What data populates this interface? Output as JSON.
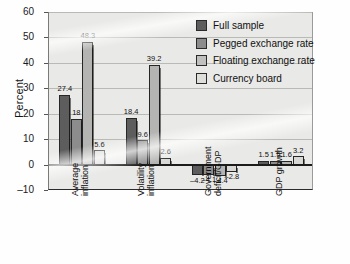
{
  "chart_data": {
    "type": "bar",
    "title": "",
    "xlabel": "",
    "ylabel": "Percent",
    "ylim": [
      -10,
      60
    ],
    "yticks": [
      60,
      50,
      40,
      30,
      20,
      10,
      0,
      -10
    ],
    "grid": true,
    "legend_position": "inside-top-right",
    "categories": [
      "Average inflation",
      "Volatility inflation",
      "Government deficit/GDP",
      "GDP growth"
    ],
    "category_lines": [
      [
        "Average",
        "inflation"
      ],
      [
        "Volatility",
        "inflation"
      ],
      [
        "Government",
        "deficit/GDP"
      ],
      [
        "GDP growth"
      ]
    ],
    "series": [
      {
        "name": "Full sample",
        "color": "#5d5d5d",
        "values": [
          27.4,
          18.4,
          -4.2,
          1.5
        ],
        "labels": [
          "27.4",
          "18.4",
          "–4.2",
          "1.5"
        ]
      },
      {
        "name": "Pegged exchange rate",
        "color": "#8c8c8c",
        "values": [
          18,
          9.6,
          -4.1,
          1.5
        ],
        "labels": [
          "18",
          "9.6",
          "–4.1",
          "1.5"
        ]
      },
      {
        "name": "Floating exchange rate",
        "color": "#b4b4b2",
        "values": [
          48.3,
          39.2,
          -4.4,
          1.6
        ],
        "labels": [
          "48.3",
          "39.2",
          "–4.4",
          "1.6"
        ]
      },
      {
        "name": "Currency board",
        "color": "#d8d8d4",
        "values": [
          5.6,
          2.6,
          -2.8,
          3.2
        ],
        "labels": [
          "5.6",
          "2.6",
          "–2.8",
          "3.2"
        ]
      }
    ]
  },
  "axis": {
    "tick_labels": [
      "60",
      "50",
      "40",
      "30",
      "20",
      "10",
      "0",
      "–10"
    ],
    "y_title": "Percent"
  },
  "legend": {
    "items": [
      {
        "label": "Full sample"
      },
      {
        "label": "Pegged exchange rate"
      },
      {
        "label": "Floating exchange rate"
      },
      {
        "label": "Currency board"
      }
    ]
  }
}
